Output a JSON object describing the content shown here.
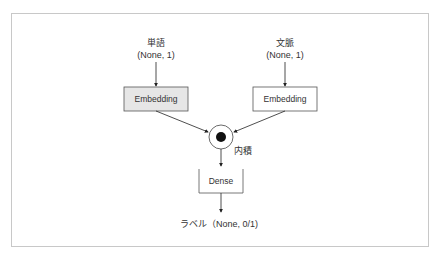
{
  "diagram": {
    "inputs": [
      {
        "name": "単語",
        "shape": "(None, 1)",
        "layer": "Embedding",
        "highlighted": true
      },
      {
        "name": "文脈",
        "shape": "(None, 1)",
        "layer": "Embedding",
        "highlighted": false
      }
    ],
    "merge": {
      "label": "内積",
      "symbol": "dot-product"
    },
    "dense": {
      "label": "Dense"
    },
    "output": {
      "label": "ラベル（None, 0/1)"
    },
    "colors": {
      "highlight_fill": "#e6e6e6",
      "line": "#333333",
      "frame": "#c8c8c8"
    }
  }
}
